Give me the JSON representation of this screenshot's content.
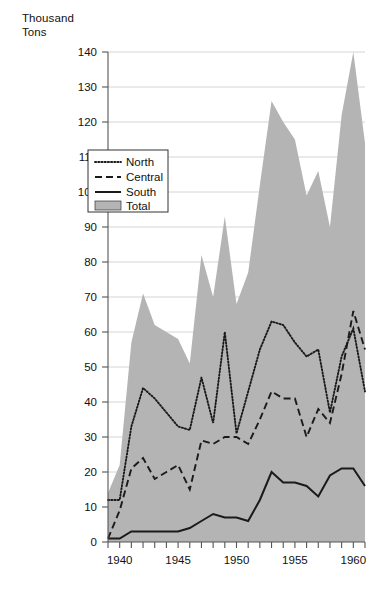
{
  "chart_data": {
    "type": "area",
    "title": "",
    "ylabel": "Thousand\nTons",
    "xlabel": "",
    "ylim": [
      0,
      140
    ],
    "xlim": [
      1939,
      1961
    ],
    "ytick_step": 10,
    "yticks": [
      0,
      10,
      20,
      30,
      40,
      50,
      60,
      70,
      80,
      90,
      100,
      110,
      120,
      130,
      140
    ],
    "xticks_labeled": [
      1940,
      1945,
      1950,
      1955,
      1960
    ],
    "xticks_all": [
      1939,
      1940,
      1941,
      1942,
      1943,
      1944,
      1945,
      1946,
      1947,
      1948,
      1949,
      1950,
      1951,
      1952,
      1953,
      1954,
      1955,
      1956,
      1957,
      1958,
      1959,
      1960,
      1961
    ],
    "grid": true,
    "legend_position": "upper-left-inside",
    "x": [
      1939,
      1940,
      1941,
      1942,
      1943,
      1944,
      1945,
      1946,
      1947,
      1948,
      1949,
      1950,
      1951,
      1952,
      1953,
      1954,
      1955,
      1956,
      1957,
      1958,
      1959,
      1960,
      1961
    ],
    "series": [
      {
        "name": "North",
        "style": "dotted",
        "color": "#1a1a1a",
        "values": [
          12,
          12,
          33,
          44,
          41,
          37,
          33,
          32,
          47,
          34,
          60,
          31,
          43,
          55,
          63,
          62,
          57,
          53,
          55,
          37,
          53,
          61,
          43
        ]
      },
      {
        "name": "Central",
        "style": "dashed",
        "color": "#1a1a1a",
        "values": [
          1,
          9,
          21,
          24,
          18,
          20,
          22,
          15,
          29,
          28,
          30,
          30,
          28,
          35,
          43,
          41,
          41,
          30,
          38,
          34,
          48,
          66,
          55
        ]
      },
      {
        "name": "South",
        "style": "solid",
        "color": "#1a1a1a",
        "values": [
          1,
          1,
          3,
          3,
          3,
          3,
          3,
          4,
          6,
          8,
          7,
          7,
          6,
          12,
          20,
          17,
          17,
          16,
          13,
          19,
          21,
          21,
          16
        ]
      },
      {
        "name": "Total",
        "style": "area",
        "color": "#b4b4b4",
        "values": [
          14,
          22,
          57,
          71,
          62,
          60,
          58,
          51,
          82,
          70,
          93,
          68,
          77,
          102,
          126,
          120,
          115,
          99,
          106,
          90,
          122,
          140,
          114
        ]
      }
    ]
  },
  "legend": {
    "items": [
      {
        "label": "North"
      },
      {
        "label": "Central"
      },
      {
        "label": "South"
      },
      {
        "label": "Total"
      }
    ]
  },
  "axis": {
    "y_title": "Thousand\nTons"
  }
}
